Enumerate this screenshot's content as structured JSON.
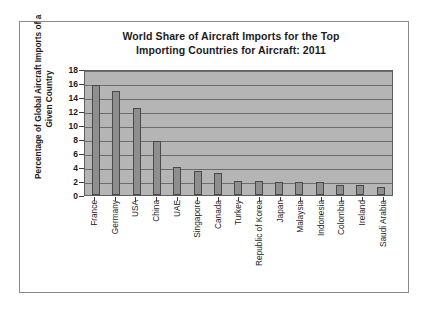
{
  "chart_data": {
    "type": "bar",
    "title": "World Share of Aircraft Imports for the Top Importing Countries for Aircraft: 2011",
    "title_lines": [
      "World Share of Aircraft Imports for the Top",
      "Importing Countries for Aircraft: 2011"
    ],
    "xlabel": "",
    "ylabel": "Percentage of Global Aircraft Imports of a Given Country",
    "ylabel_lines": [
      "Percentage of Global Aircraft Imports of a",
      "Given Country"
    ],
    "ylim": [
      0,
      18
    ],
    "yticks": [
      0,
      2,
      4,
      6,
      8,
      10,
      12,
      14,
      16,
      18
    ],
    "ytick_labels": [
      "0",
      "2",
      "4",
      "6",
      "8",
      "10",
      "12",
      "14",
      "16",
      "18"
    ],
    "grid": true,
    "legend": null,
    "categories": [
      "France",
      "Germany",
      "USA",
      "China",
      "UAE",
      "Singapore",
      "Canada",
      "Turkey",
      "Republic of Korea",
      "Japan",
      "Malaysia",
      "Indonesia",
      "Colombia",
      "Ireland",
      "Saudi Arabia"
    ],
    "values": [
      15.7,
      14.8,
      12.4,
      7.7,
      4.0,
      3.4,
      3.2,
      2.0,
      2.0,
      1.9,
      1.8,
      1.8,
      1.4,
      1.4,
      1.2
    ],
    "bar_color": "#8e8e8e",
    "plot_background": "#b5b5b5",
    "axis_color": "#3d3d3d"
  }
}
